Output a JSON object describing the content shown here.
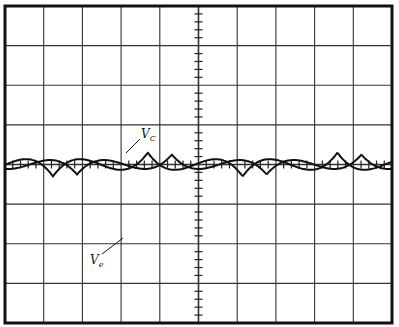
{
  "chart_data": {
    "type": "line",
    "title": "",
    "xlabel": "",
    "ylabel": "",
    "grid": true,
    "divisions": {
      "x": 10,
      "y": 8
    },
    "minor_ticks_per_division": 5,
    "xlim": [
      0,
      10
    ],
    "ylim": [
      -4,
      4
    ],
    "series": [
      {
        "name": "Ve",
        "label_main": "V",
        "label_sub": "e",
        "amplitude_div": 3.0,
        "period_div": 4.9,
        "peaks_x_div": [
          1.24,
          6.15
        ],
        "troughs_x_div": [
          3.7,
          8.68
        ],
        "start_y_div": -1.3
      },
      {
        "name": "Vc",
        "label_main": "V",
        "label_sub": "C",
        "amplitude_div": 2.5,
        "period_div": 4.9,
        "peaks_x_div": [
          1.86,
          6.85
        ],
        "troughs_x_div": [
          4.4,
          9.27
        ],
        "start_y_div": -2.5
      }
    ]
  },
  "labels": {
    "vc": {
      "main": "V",
      "sub": "C"
    },
    "ve": {
      "main": "V",
      "sub": "e"
    }
  }
}
